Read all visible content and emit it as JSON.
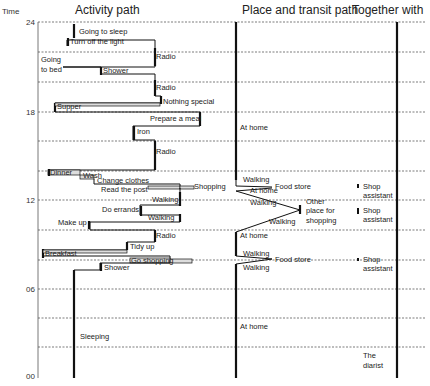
{
  "headers": {
    "time": "Time",
    "activity": "Activity path",
    "place": "Place and transit path",
    "together": "Together with"
  },
  "time_ticks": [
    {
      "label": "24",
      "y": 22
    },
    {
      "label": "18",
      "y": 112
    },
    {
      "label": "12",
      "y": 200
    },
    {
      "label": "06",
      "y": 289
    },
    {
      "label": "00",
      "y": 376
    }
  ],
  "gridlines_y": [
    22,
    52,
    82,
    112,
    141,
    171,
    200,
    230,
    260,
    289,
    318,
    347
  ],
  "activity_labels": [
    {
      "text": "Going to sleep",
      "x": 79,
      "y": 34
    },
    {
      "text": "Turn off the light",
      "x": 70,
      "y": 44
    },
    {
      "text": "Radio",
      "x": 156,
      "y": 59
    },
    {
      "text": "Going",
      "x": 41,
      "y": 62
    },
    {
      "text": "to bed",
      "x": 41,
      "y": 72
    },
    {
      "text": "Shower",
      "x": 103,
      "y": 73
    },
    {
      "text": "Radio",
      "x": 156,
      "y": 90
    },
    {
      "text": "Nothing special",
      "x": 163,
      "y": 104
    },
    {
      "text": "Supper",
      "x": 57,
      "y": 109
    },
    {
      "text": "Prepare a meal",
      "x": 150,
      "y": 121
    },
    {
      "text": "Iron",
      "x": 137,
      "y": 134
    },
    {
      "text": "Radio",
      "x": 156,
      "y": 154
    },
    {
      "text": "Dinner",
      "x": 50,
      "y": 175
    },
    {
      "text": "Wash",
      "x": 83,
      "y": 178
    },
    {
      "text": "Change clothes",
      "x": 97,
      "y": 183
    },
    {
      "text": "Read the post",
      "x": 101,
      "y": 192
    },
    {
      "text": "Shopping",
      "x": 194,
      "y": 189
    },
    {
      "text": "Walking",
      "x": 152,
      "y": 202
    },
    {
      "text": "Do errands",
      "x": 102,
      "y": 212
    },
    {
      "text": "Walking",
      "x": 148,
      "y": 220
    },
    {
      "text": "Make up",
      "x": 58,
      "y": 225
    },
    {
      "text": "Radio",
      "x": 156,
      "y": 238
    },
    {
      "text": "Tidy up",
      "x": 130,
      "y": 249
    },
    {
      "text": "Breakfast",
      "x": 45,
      "y": 256
    },
    {
      "text": "Go shopping",
      "x": 131,
      "y": 263
    },
    {
      "text": "Shower",
      "x": 104,
      "y": 270
    },
    {
      "text": "Sleeping",
      "x": 80,
      "y": 339
    }
  ],
  "place_labels": [
    {
      "text": "At home",
      "x": 240,
      "y": 130
    },
    {
      "text": "Walking",
      "x": 243,
      "y": 182
    },
    {
      "text": "Food store",
      "x": 275,
      "y": 189
    },
    {
      "text": "At home",
      "x": 250,
      "y": 193
    },
    {
      "text": "Walking",
      "x": 250,
      "y": 205
    },
    {
      "text": "Other",
      "x": 306,
      "y": 204
    },
    {
      "text": "place for",
      "x": 306,
      "y": 213
    },
    {
      "text": "shopping",
      "x": 306,
      "y": 223
    },
    {
      "text": "Walking",
      "x": 269,
      "y": 224
    },
    {
      "text": "At home",
      "x": 240,
      "y": 238
    },
    {
      "text": "Walking",
      "x": 243,
      "y": 256
    },
    {
      "text": "Food store",
      "x": 275,
      "y": 262
    },
    {
      "text": "Walking",
      "x": 243,
      "y": 270
    },
    {
      "text": "At home",
      "x": 240,
      "y": 329
    }
  ],
  "together_labels": [
    {
      "text": "Shop",
      "x": 363,
      "y": 189
    },
    {
      "text": "assistant",
      "x": 363,
      "y": 198
    },
    {
      "text": "Shop",
      "x": 363,
      "y": 213
    },
    {
      "text": "assistant",
      "x": 363,
      "y": 222
    },
    {
      "text": "Shop",
      "x": 363,
      "y": 262
    },
    {
      "text": "assistant",
      "x": 363,
      "y": 271
    },
    {
      "text": "The",
      "x": 363,
      "y": 358
    },
    {
      "text": "diarist",
      "x": 363,
      "y": 368
    }
  ]
}
